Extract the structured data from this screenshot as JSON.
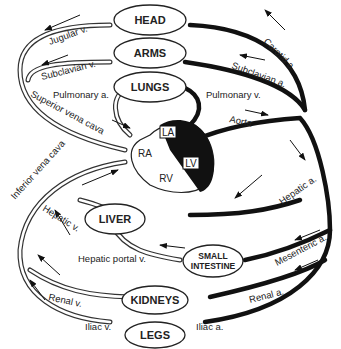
{
  "diagram": {
    "organs": {
      "head": "HEAD",
      "arms": "ARMS",
      "lungs": "LUNGS",
      "liver": "LIVER",
      "small_intestine_line1": "SMALL",
      "small_intestine_line2": "INTESTINE",
      "kidneys": "KIDNEYS",
      "legs": "LEGS"
    },
    "heart_chambers": {
      "la": "LA",
      "lv": "LV",
      "ra": "RA",
      "rv": "RV"
    },
    "veins": {
      "jugular": "Jugular v.",
      "subclavian": "Subclavian v.",
      "superior_vena_cava": "Superior vena cava",
      "inferior_vena_cava": "Inferior vena cava",
      "hepatic": "Hepatic v.",
      "hepatic_portal": "Hepatic portal v.",
      "renal": "Renal v.",
      "iliac": "Iliac v.",
      "pulmonary": "Pulmonary v."
    },
    "arteries": {
      "carotid": "Carotid a.",
      "subclavian": "Subclavian a.",
      "pulmonary": "Pulmonary a.",
      "aorta": "Aorta",
      "hepatic": "Hepatic a.",
      "mesenteric": "Mesenteric a.",
      "renal": "Renal a.",
      "iliac": "Iliac a."
    },
    "colors": {
      "artery": "#111111",
      "vein_outline": "#333333",
      "background": "#ffffff"
    }
  }
}
